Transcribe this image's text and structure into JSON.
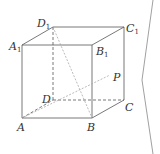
{
  "figure": {
    "type": "cube",
    "vertices": {
      "A": {
        "label": "A",
        "sub": "",
        "x": 22,
        "y": 118
      },
      "B": {
        "label": "B",
        "sub": "",
        "x": 92,
        "y": 118
      },
      "C": {
        "label": "C",
        "sub": "",
        "x": 124,
        "y": 100
      },
      "D": {
        "label": "D",
        "sub": "",
        "x": 53,
        "y": 100
      },
      "A1": {
        "label": "A",
        "sub": "1",
        "x": 22,
        "y": 45
      },
      "B1": {
        "label": "B",
        "sub": "1",
        "x": 92,
        "y": 45
      },
      "C1": {
        "label": "C",
        "sub": "1",
        "x": 124,
        "y": 27
      },
      "D1": {
        "label": "D",
        "sub": "1",
        "x": 53,
        "y": 27
      }
    },
    "point_P": {
      "label": "P",
      "x": 110,
      "y": 75
    },
    "solid_edges": [
      "A-B",
      "B-B1",
      "B1-A1",
      "A1-A",
      "A1-D1",
      "D1-C1",
      "C1-B1",
      "C1-C",
      "C-B"
    ],
    "dashed_edges": [
      "A-D",
      "D-C",
      "D-D1"
    ],
    "dotted_segments": [
      "D1-B",
      "A-P"
    ],
    "line_color": "#555555",
    "dotted_color": "#aaaaaa"
  },
  "labels": {
    "A": "A",
    "B": "B",
    "C": "C",
    "D": "D",
    "A1": "A",
    "B1": "B",
    "C1": "C",
    "D1": "D",
    "sub1": "1",
    "P": "P"
  },
  "bracket": {
    "color": "#888888"
  }
}
